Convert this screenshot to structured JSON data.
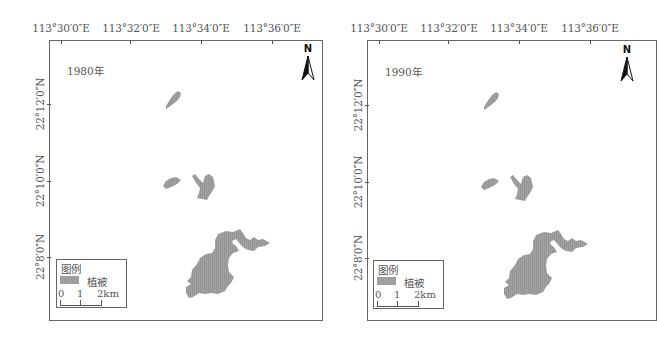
{
  "figure": {
    "type": "vegetation distribution maps",
    "panels": [
      {
        "year_label": "1980年",
        "x_axis_labels": [
          "113°30′0″E",
          "113°32′0″E",
          "113°34′0″E",
          "113°36′0″E"
        ],
        "y_axis_labels": [
          "22°12′0″N",
          "22°10′0″N",
          "22°8′0″N"
        ],
        "north_label": "N",
        "legend": {
          "title": "图例",
          "item_label": "植被",
          "scale": [
            "0",
            "1",
            "2km"
          ]
        }
      },
      {
        "year_label": "1990年",
        "x_axis_labels": [
          "113°30′0″E",
          "113°32′0″E",
          "113°34′0″E",
          "113°36′0″E"
        ],
        "y_axis_labels": [
          "22°12′0″N",
          "22°10′0″N",
          "22°8′0″N"
        ],
        "north_label": "N",
        "legend": {
          "title": "图例",
          "item_label": "植被",
          "scale": [
            "0",
            "1",
            "2km"
          ]
        }
      }
    ],
    "colors": {
      "vegetation": "#9b9b9b",
      "frame": "#666666",
      "text": "#555555"
    }
  }
}
